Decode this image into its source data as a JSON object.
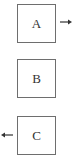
{
  "diagram": {
    "boxes": [
      {
        "id": "A",
        "label": "A",
        "arrow": "right"
      },
      {
        "id": "B",
        "label": "B",
        "arrow": null
      },
      {
        "id": "C",
        "label": "C",
        "arrow": "left"
      }
    ],
    "colors": {
      "border": "#6e6e6e",
      "text": "#333333",
      "arrow": "#333333",
      "background": "#ffffff"
    }
  }
}
